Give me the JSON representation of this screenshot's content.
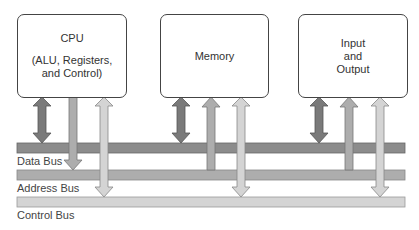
{
  "diagram": {
    "components": [
      {
        "id": "cpu",
        "title": "CPU",
        "subtitle_line1": "(ALU, Registers,",
        "subtitle_line2": "and Control)"
      },
      {
        "id": "memory",
        "title": "Memory"
      },
      {
        "id": "io",
        "line1": "Input",
        "line2": "and",
        "line3": "Output"
      }
    ],
    "buses": [
      {
        "name": "Data Bus",
        "color": "#8c8c8c"
      },
      {
        "name": "Address Bus",
        "color": "#adadad"
      },
      {
        "name": "Control Bus",
        "color": "#d4d4d4"
      }
    ],
    "connections": [
      {
        "from": "cpu",
        "bus": "Data Bus",
        "direction": "bidirectional"
      },
      {
        "from": "cpu",
        "bus": "Address Bus",
        "direction": "to-bus"
      },
      {
        "from": "cpu",
        "bus": "Control Bus",
        "direction": "bidirectional"
      },
      {
        "from": "memory",
        "bus": "Data Bus",
        "direction": "bidirectional"
      },
      {
        "from": "memory",
        "bus": "Address Bus",
        "direction": "to-component"
      },
      {
        "from": "memory",
        "bus": "Control Bus",
        "direction": "bidirectional"
      },
      {
        "from": "io",
        "bus": "Data Bus",
        "direction": "bidirectional"
      },
      {
        "from": "io",
        "bus": "Address Bus",
        "direction": "to-component"
      },
      {
        "from": "io",
        "bus": "Control Bus",
        "direction": "bidirectional"
      }
    ]
  }
}
